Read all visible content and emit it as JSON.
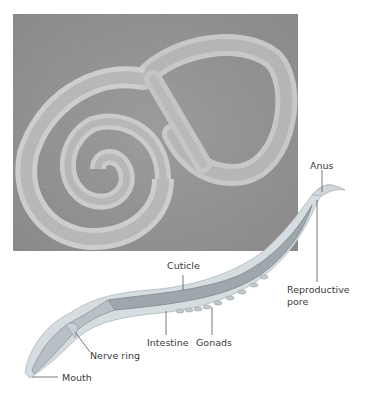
{
  "figure": {
    "photo": {
      "subject": "micrograph of coiled nematode worm",
      "background_color": "#8f8f8f"
    },
    "diagram": {
      "subject": "nematode anatomy illustration",
      "labels": {
        "anus": "Anus",
        "reproductive_pore_line1": "Reproductive",
        "reproductive_pore_line2": "pore",
        "cuticle": "Cuticle",
        "intestine": "Intestine",
        "gonads": "Gonads",
        "nerve_ring": "Nerve ring",
        "mouth": "Mouth"
      }
    }
  }
}
